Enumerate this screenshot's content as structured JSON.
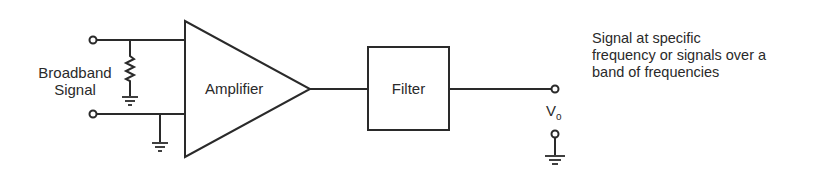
{
  "diagram": {
    "type": "signal-chain block diagram",
    "input_label_line1": "Broadband",
    "input_label_line2": "Signal",
    "amplifier_label": "Amplifier",
    "filter_label": "Filter",
    "output_label": "V",
    "output_label_subscript": "o",
    "description_lines": [
      "Signal at specific",
      "frequency or signals over a",
      "band of frequencies"
    ],
    "line_color": "#2a2a2a"
  }
}
